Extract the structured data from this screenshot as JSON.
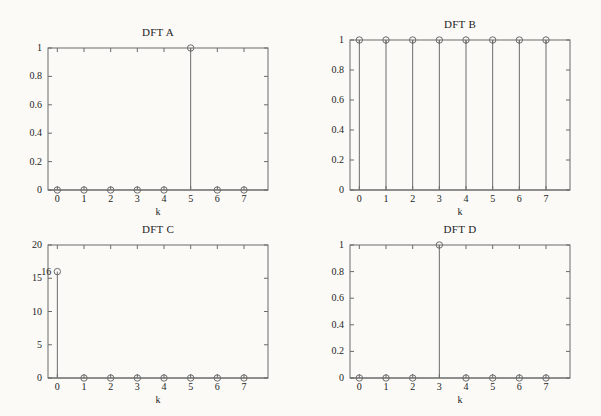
{
  "figure": {
    "background_color": "#fbfaf7",
    "axis_color": "#6b6b6b",
    "text_color": "#1d1d1d",
    "marker": "open-circle"
  },
  "chart_data": [
    {
      "type": "bar",
      "id": "dft-a",
      "title": "DFT A",
      "xlabel": "k",
      "ylabel": "",
      "categories": [
        "0",
        "1",
        "2",
        "3",
        "4",
        "5",
        "6",
        "7"
      ],
      "x": [
        0,
        1,
        2,
        3,
        4,
        5,
        6,
        7
      ],
      "values": [
        0,
        0,
        0,
        0,
        0,
        1,
        0,
        0
      ],
      "xlim": [
        -0.35,
        7.9
      ],
      "ylim": [
        0,
        1
      ],
      "xticks": [
        0,
        1,
        2,
        3,
        4,
        5,
        6,
        7
      ],
      "xticklabels": [
        "0",
        "1",
        "2",
        "3",
        "4",
        "5",
        "6",
        "7"
      ],
      "yticks": [
        0,
        0.2,
        0.4,
        0.6,
        0.8,
        1
      ],
      "yticklabels": [
        "0",
        "0.2",
        "0.4",
        "0.6",
        "0.8",
        "1"
      ],
      "grid": false,
      "legend": "none",
      "annotations": []
    },
    {
      "type": "bar",
      "id": "dft-b",
      "title": "DFT B",
      "xlabel": "k",
      "ylabel": "",
      "categories": [
        "0",
        "1",
        "2",
        "3",
        "4",
        "5",
        "6",
        "7"
      ],
      "x": [
        0,
        1,
        2,
        3,
        4,
        5,
        6,
        7
      ],
      "values": [
        1,
        1,
        1,
        1,
        1,
        1,
        1,
        1
      ],
      "xlim": [
        -0.35,
        7.9
      ],
      "ylim": [
        0,
        1
      ],
      "xticks": [
        0,
        1,
        2,
        3,
        4,
        5,
        6,
        7
      ],
      "xticklabels": [
        "0",
        "1",
        "2",
        "3",
        "4",
        "5",
        "6",
        "7"
      ],
      "yticks": [
        0,
        0.2,
        0.4,
        0.6,
        0.8,
        1
      ],
      "yticklabels": [
        "0",
        "0.2",
        "0.4",
        "0.6",
        "0.8",
        "1"
      ],
      "grid": false,
      "legend": "none",
      "annotations": []
    },
    {
      "type": "bar",
      "id": "dft-c",
      "title": "DFT C",
      "xlabel": "k",
      "ylabel": "",
      "categories": [
        "0",
        "1",
        "2",
        "3",
        "4",
        "5",
        "6",
        "7"
      ],
      "x": [
        0,
        1,
        2,
        3,
        4,
        5,
        6,
        7
      ],
      "values": [
        16,
        0,
        0,
        0,
        0,
        0,
        0,
        0
      ],
      "xlim": [
        -0.35,
        7.9
      ],
      "ylim": [
        0,
        20
      ],
      "xticks": [
        0,
        1,
        2,
        3,
        4,
        5,
        6,
        7
      ],
      "xticklabels": [
        "0",
        "1",
        "2",
        "3",
        "4",
        "5",
        "6",
        "7"
      ],
      "yticks": [
        0,
        5,
        10,
        15,
        20
      ],
      "yticklabels": [
        "0",
        "5",
        "10",
        "15",
        "20"
      ],
      "grid": false,
      "legend": "none",
      "annotations": [
        {
          "text": "16",
          "x": 0,
          "y": 16
        }
      ]
    },
    {
      "type": "bar",
      "id": "dft-d",
      "title": "DFT D",
      "xlabel": "k",
      "ylabel": "",
      "categories": [
        "0",
        "1",
        "2",
        "3",
        "4",
        "5",
        "6",
        "7"
      ],
      "x": [
        0,
        1,
        2,
        3,
        4,
        5,
        6,
        7
      ],
      "values": [
        0,
        0,
        0,
        1,
        0,
        0,
        0,
        0
      ],
      "xlim": [
        -0.35,
        7.9
      ],
      "ylim": [
        0,
        1
      ],
      "xticks": [
        0,
        1,
        2,
        3,
        4,
        5,
        6,
        7
      ],
      "xticklabels": [
        "0",
        "1",
        "2",
        "3",
        "4",
        "5",
        "6",
        "7"
      ],
      "yticks": [
        0,
        0.2,
        0.4,
        0.6,
        0.8,
        1
      ],
      "yticklabels": [
        "0",
        "0.2",
        "0.4",
        "0.6",
        "0.8",
        "1"
      ],
      "grid": false,
      "legend": "none",
      "annotations": []
    }
  ],
  "layout": {
    "panels": [
      {
        "chart": 0,
        "left": 0,
        "top": 8,
        "width": 300,
        "height": 200,
        "plot_left": 48,
        "plot_top": 40,
        "plot_width": 220,
        "plot_height": 142
      },
      {
        "chart": 1,
        "left": 300,
        "top": 8,
        "width": 301,
        "height": 200,
        "plot_left": 50,
        "plot_top": 32,
        "plot_width": 220,
        "plot_height": 150
      },
      {
        "chart": 2,
        "left": 0,
        "top": 213,
        "width": 300,
        "height": 203,
        "plot_left": 48,
        "plot_top": 32,
        "plot_width": 220,
        "plot_height": 133
      },
      {
        "chart": 3,
        "left": 300,
        "top": 213,
        "width": 301,
        "height": 203,
        "plot_left": 50,
        "plot_top": 32,
        "plot_width": 220,
        "plot_height": 133
      }
    ]
  }
}
